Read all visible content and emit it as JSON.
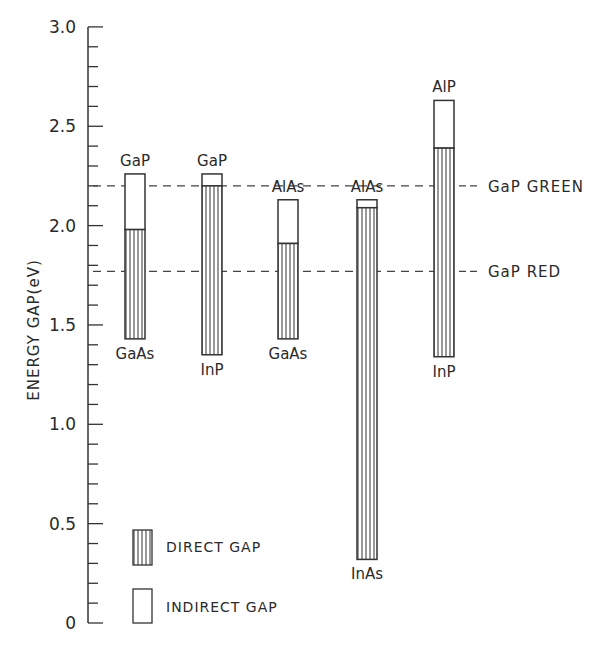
{
  "chart_data": {
    "type": "bar",
    "subtype": "floating-stacked",
    "title": "",
    "xlabel": "",
    "ylabel": "ENERGY GAP(eV)",
    "ylim": [
      0,
      3.0
    ],
    "yticks_major": [
      0,
      0.5,
      1.0,
      1.5,
      2.0,
      2.5,
      3.0
    ],
    "ytick_labels": [
      "0",
      "0.5",
      "1.0",
      "1.5",
      "2.0",
      "2.5",
      "3.0"
    ],
    "yticks_minor_step": 0.1,
    "grid": false,
    "bars": [
      {
        "top_label": "GaP",
        "bottom_label": "GaAs",
        "bottom": 1.43,
        "direct_top": 1.98,
        "top": 2.26
      },
      {
        "top_label": "GaP",
        "bottom_label": "InP",
        "bottom": 1.35,
        "direct_top": 2.2,
        "top": 2.26
      },
      {
        "top_label": "AlAs",
        "bottom_label": "GaAs",
        "bottom": 1.43,
        "direct_top": 1.91,
        "top": 2.13
      },
      {
        "top_label": "AlAs",
        "bottom_label": "InAs",
        "bottom": 0.32,
        "direct_top": 2.09,
        "top": 2.13
      },
      {
        "top_label": "AlP",
        "bottom_label": "InP",
        "bottom": 1.34,
        "direct_top": 2.39,
        "top": 2.63
      }
    ],
    "reference_lines": [
      {
        "label": "GaP GREEN",
        "value": 2.2
      },
      {
        "label": "GaP RED",
        "value": 1.77
      }
    ],
    "legend": {
      "position": "lower-left",
      "entries": [
        {
          "label": "DIRECT GAP",
          "style": "vertical-hatch"
        },
        {
          "label": "INDIRECT GAP",
          "style": "open"
        }
      ]
    }
  },
  "labels": {
    "y_axis_title": "ENERGY GAP(eV)",
    "legend_direct": "DIRECT GAP",
    "legend_indirect": "INDIRECT GAP",
    "ref_green": "GaP GREEN",
    "ref_red": "GaP RED"
  }
}
